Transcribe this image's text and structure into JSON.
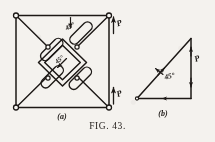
{
  "figure": {
    "caption_prefix": "F",
    "caption_smallcaps": "IG",
    "caption_rest": ". 43.",
    "caption_full": "FIG. 43.",
    "ink_color": "#201c19",
    "paper_color": "#f4f2ee"
  },
  "panel_a": {
    "sublabel": "(a)",
    "angle_label": "45°",
    "inner_label": "45°",
    "load_top_label": "P",
    "load_bottom_label": "P",
    "joints": 4,
    "description": "square pin-jointed frame with diagonals and central rhombus linkage"
  },
  "panel_b": {
    "sublabel": "(b)",
    "angle_label": "45°",
    "force_label": "P",
    "description": "force triangle, right angle at lower right, 45 degrees at lower left"
  }
}
